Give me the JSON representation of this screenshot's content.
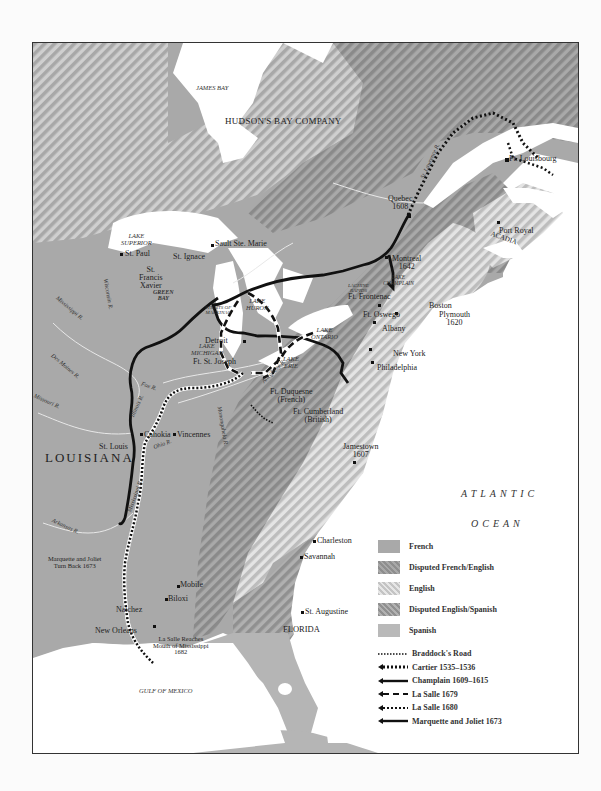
{
  "map": {
    "regions": {
      "hudson_bay_company": "HUDSON'S BAY COMPANY",
      "louisiana": "LOUISIANA",
      "acadia": "ACADIA",
      "florida": "FLORIDA"
    },
    "water": {
      "james_bay": "JAMES BAY",
      "lake_superior": [
        "LAKE",
        "SUPERIOR"
      ],
      "lake_michigan": [
        "LAKE",
        "MICHIGAN"
      ],
      "lake_huron": [
        "LAKE",
        "HURON"
      ],
      "lake_ontario": [
        "LAKE",
        "ONTARIO"
      ],
      "lake_erie": [
        "LAKE",
        "ERIE"
      ],
      "lake_champlain": [
        "LAKE",
        "CHAMPLAIN"
      ],
      "lachine_rapids": [
        "LACHINE",
        "RAPIDS"
      ],
      "straits_of_mackinac": [
        "STRAITS OF",
        "MACKINAC"
      ],
      "green_bay": [
        "GREEN",
        "BAY"
      ],
      "atlantic": "ATLANTIC",
      "ocean": "OCEAN",
      "gulf_of_mexico": "GULF OF MEXICO"
    },
    "rivers": {
      "st_lawrence": "St. Lawrence R.",
      "wisconsin": "Wisconsin R.",
      "mississippi_upper": "Mississippi R.",
      "des_moines": "Des Moines R.",
      "missouri": "Missouri R.",
      "illinois": "Illinois R.",
      "fox": "Fox R.",
      "ohio": "Ohio R.",
      "mississippi_lower": "Mississippi R.",
      "arkansas": "Arkansas R.",
      "allegheny": "Allegheny R.",
      "monongahela": "Monongahela R."
    },
    "places": {
      "quebec": [
        "Quebec",
        "1608"
      ],
      "montreal": [
        "Montreal",
        "1642"
      ],
      "louisbourg": "Ft. Louisbourg",
      "port_royal": "Port Royal",
      "sault_ste_marie": "Sault Ste. Marie",
      "st_ignace": "St. Ignace",
      "st_francis_xavier": [
        "St.",
        "Francis",
        "Xavier"
      ],
      "st_paul": "St. Paul",
      "ft_frontenac": "Ft. Frontenac",
      "ft_oswego": "Ft. Oswego",
      "boston": "Boston",
      "plymouth": [
        "Plymouth",
        "1620"
      ],
      "albany": "Albany",
      "new_york": "New York",
      "philadelphia": "Philadelphia",
      "detroit": "Detroit",
      "ft_st_joseph": "Ft. St. Joseph",
      "ft_duquesne": [
        "Ft. Duquesne",
        "(French)"
      ],
      "ft_cumberland": [
        "Ft. Cumberland",
        "(British)"
      ],
      "jamestown": [
        "Jamestown",
        "1607"
      ],
      "cahokia": "Cahokia",
      "vincennes": "Vincennes",
      "st_louis": "St. Louis",
      "marquette_turn_back": [
        "Marquette and Joliet",
        "Turn Back 1673"
      ],
      "natchez": "Natchez",
      "mobile": "Mobile",
      "biloxi": "Biloxi",
      "new_orleans": "New Orleans",
      "la_salle_reaches": [
        "La Salle Reaches",
        "Mouth of Mississippi",
        "1682"
      ],
      "charleston": "Charleston",
      "savannah": "Savannah",
      "st_augustine": "St. Augustine"
    }
  },
  "legend": {
    "areas": [
      {
        "label": "French"
      },
      {
        "label": "Disputed French/English"
      },
      {
        "label": "English"
      },
      {
        "label": "Disputed English/Spanish"
      },
      {
        "label": "Spanish"
      }
    ],
    "routes": [
      {
        "label": "Braddock's Road"
      },
      {
        "label": "Cartier 1535–1536"
      },
      {
        "label": "Champlain 1609–1615"
      },
      {
        "label": "La Salle 1679"
      },
      {
        "label": "La Salle 1680"
      },
      {
        "label": "Marquette and Joliet 1673"
      }
    ]
  },
  "colors": {
    "french": "#a9a9a9",
    "english_light": "#e6e6e6",
    "english_dark": "#c4c4c4",
    "disputed_dark": "#8e8e8e",
    "water": "#ffffff",
    "route": "#111111"
  }
}
